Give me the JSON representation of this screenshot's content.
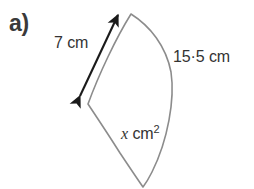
{
  "figure": {
    "part_label": "a)",
    "shape_name": "circular-sector",
    "outline_color": "#8c8c8c",
    "arrow_color": "#1a1a1a",
    "text_color": "#333333",
    "background_color": "#ffffff"
  },
  "labels": {
    "left_side": "7 cm",
    "arc": "15·5 cm",
    "area_value": "x",
    "area_unit": "cm",
    "area_exponent": "2"
  },
  "geometry": {
    "apex": [
      131,
      14
    ],
    "left_vertex": [
      88,
      104
    ],
    "bottom_vertex": [
      143,
      187
    ],
    "arc_max_x": 172,
    "arrow_start": [
      78,
      98
    ],
    "arrow_end": [
      120,
      12
    ]
  }
}
